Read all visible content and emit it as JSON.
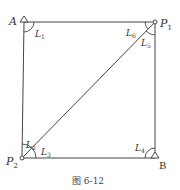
{
  "diagram": {
    "caption": "图 6-12",
    "points": {
      "A": {
        "label": "A",
        "marker": "triangle"
      },
      "B": {
        "label": "B",
        "marker": "triangle"
      },
      "P1": {
        "label": "P",
        "sub": "1",
        "marker": "circle"
      },
      "P2": {
        "label": "P",
        "sub": "2",
        "marker": "circle"
      }
    },
    "angles": [
      {
        "label": "L",
        "sub": "1",
        "at": "A"
      },
      {
        "label": "L",
        "sub": "2",
        "at": "P2"
      },
      {
        "label": "L",
        "sub": "3",
        "at": "P2"
      },
      {
        "label": "L",
        "sub": "4",
        "at": "B"
      },
      {
        "label": "L",
        "sub": "5",
        "at": "P1"
      },
      {
        "label": "L",
        "sub": "6",
        "at": "P1"
      }
    ],
    "edges": [
      "A-P1",
      "P1-B",
      "B-P2",
      "P2-A",
      "P2-P1"
    ],
    "colors": {
      "line": "#444444",
      "text": "#333333"
    }
  }
}
